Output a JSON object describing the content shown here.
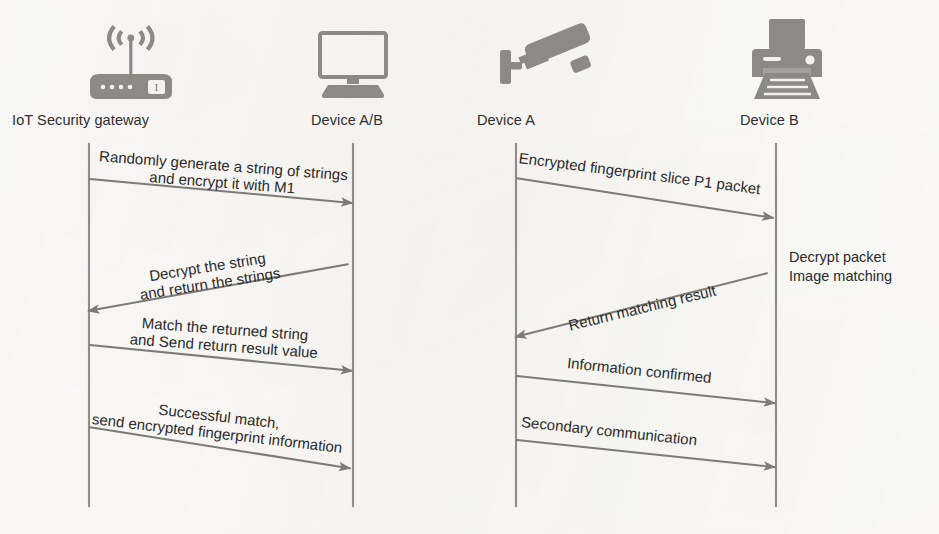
{
  "figure": {
    "kind": "uml-sequence-diagram-pair",
    "background_color": "#f8f7f4",
    "ink_color": "#3b3b3b",
    "lifeline_color": "#8f8d88"
  },
  "diagrams": [
    {
      "id": "left",
      "actors": [
        {
          "id": "gateway",
          "label": "IoT Security gateway",
          "icon": "wifi-router-icon",
          "lifeline_x": 88
        },
        {
          "id": "device_ab",
          "label": "Device A/B",
          "icon": "desktop-monitor-icon",
          "lifeline_x": 352
        }
      ],
      "messages": [
        {
          "id": "m1",
          "label": "Randomly generate a string of strings\nand encrypt it with M1",
          "direction": "right",
          "from": "gateway",
          "to": "device_ab"
        },
        {
          "id": "m2",
          "label": "Decrypt the string\nand return the strings",
          "direction": "left",
          "from": "device_ab",
          "to": "gateway"
        },
        {
          "id": "m3",
          "label": "Match the returned string\nand Send return result value",
          "direction": "right",
          "from": "gateway",
          "to": "device_ab"
        },
        {
          "id": "m4",
          "label": "Successful match,\nsend encrypted fingerprint information",
          "direction": "right",
          "from": "gateway",
          "to": "device_ab"
        }
      ],
      "notes": []
    },
    {
      "id": "right",
      "actors": [
        {
          "id": "device_a",
          "label": "Device A",
          "icon": "cctv-camera-icon",
          "lifeline_x": 515
        },
        {
          "id": "device_b",
          "label": "Device B",
          "icon": "printer-icon",
          "lifeline_x": 775
        }
      ],
      "messages": [
        {
          "id": "m5",
          "label": "Encrypted fingerprint slice P1 packet",
          "direction": "right",
          "from": "device_a",
          "to": "device_b"
        },
        {
          "id": "m6",
          "label": "Return matching result",
          "direction": "left",
          "from": "device_b",
          "to": "device_a"
        },
        {
          "id": "m7",
          "label": "Information confirmed",
          "direction": "right",
          "from": "device_a",
          "to": "device_b"
        },
        {
          "id": "m8",
          "label": "Secondary communication",
          "direction": "right",
          "from": "device_a",
          "to": "device_b"
        }
      ],
      "notes": [
        {
          "id": "n1",
          "label": "Decrypt packet\nImage matching",
          "anchor": "device_b"
        }
      ]
    }
  ]
}
